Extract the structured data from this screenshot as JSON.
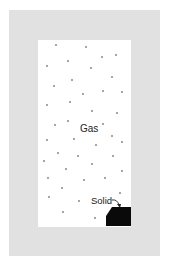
{
  "diagram": {
    "type": "gas-solid-equilibrium-container",
    "labels": {
      "gas": "Gas",
      "solid": "Solid"
    },
    "colors": {
      "frame": "#e1e1e1",
      "chamber": "#ffffff",
      "solid": "#0a0a0a",
      "particle": "#333333",
      "text": "#222222"
    },
    "gas_particles": [
      [
        56,
        45
      ],
      [
        86,
        47
      ],
      [
        116,
        55
      ],
      [
        102,
        57
      ],
      [
        68,
        61
      ],
      [
        47,
        66
      ],
      [
        91,
        68
      ],
      [
        112,
        77
      ],
      [
        72,
        80
      ],
      [
        54,
        86
      ],
      [
        83,
        94
      ],
      [
        103,
        91
      ],
      [
        122,
        92
      ],
      [
        70,
        102
      ],
      [
        47,
        105
      ],
      [
        92,
        111
      ],
      [
        117,
        113
      ],
      [
        68,
        121
      ],
      [
        55,
        125
      ],
      [
        103,
        124
      ],
      [
        47,
        140
      ],
      [
        74,
        139
      ],
      [
        112,
        136
      ],
      [
        122,
        142
      ],
      [
        96,
        145
      ],
      [
        58,
        153
      ],
      [
        78,
        156
      ],
      [
        113,
        156
      ],
      [
        44,
        161
      ],
      [
        92,
        164
      ],
      [
        66,
        169
      ],
      [
        122,
        171
      ],
      [
        48,
        178
      ],
      [
        84,
        180
      ],
      [
        105,
        178
      ],
      [
        62,
        188
      ],
      [
        120,
        193
      ],
      [
        49,
        197
      ],
      [
        79,
        201
      ],
      [
        63,
        212
      ],
      [
        95,
        218
      ]
    ]
  }
}
